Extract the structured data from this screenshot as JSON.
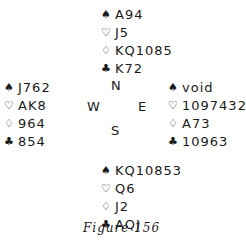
{
  "suits": {
    "spades": "♠",
    "hearts": "♡",
    "diamonds": "♢",
    "clubs": "♣"
  },
  "hands": {
    "north": {
      "spades": "A94",
      "hearts": "J5",
      "diamonds": "KQ1085",
      "clubs": "K72"
    },
    "west": {
      "spades": "J762",
      "hearts": "AK8",
      "diamonds": "964",
      "clubs": "854"
    },
    "east": {
      "spades": "void",
      "hearts": "1097432",
      "diamonds": "A73",
      "clubs": "10963"
    },
    "south": {
      "spades": "KQ10853",
      "hearts": "Q6",
      "diamonds": "J2",
      "clubs": "AQJ"
    }
  },
  "compass": {
    "n": "N",
    "w": "W",
    "e": "E",
    "s": "S"
  },
  "caption": "Figure 156"
}
